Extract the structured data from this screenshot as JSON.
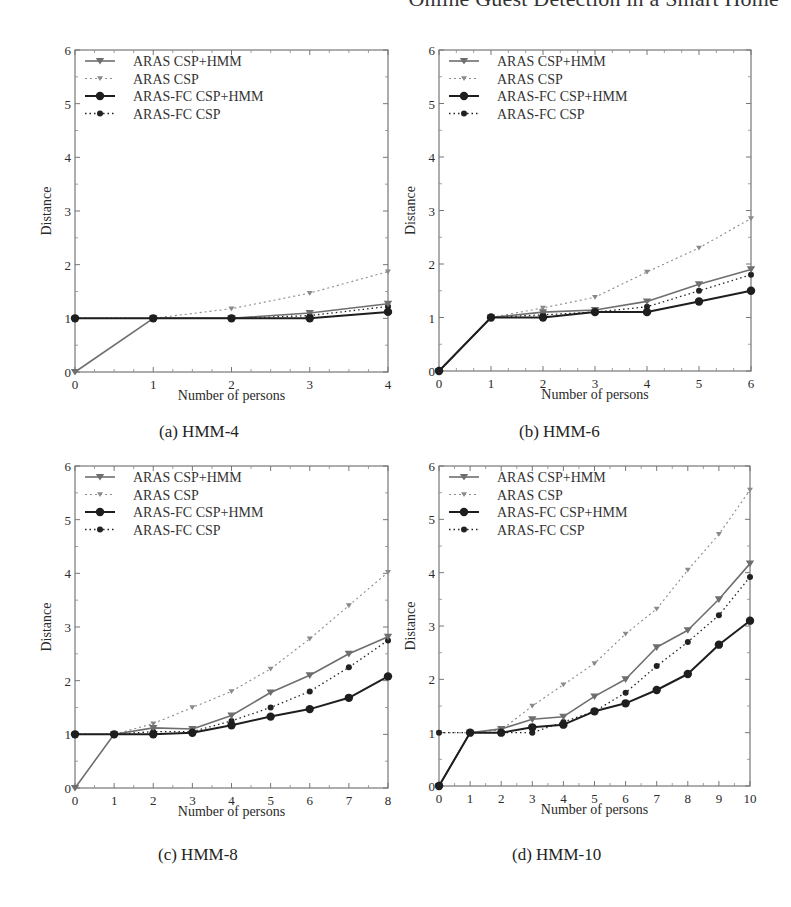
{
  "header": {
    "title": "Online Guest Detection in a Smart Home"
  },
  "legend": [
    {
      "label": "ARAS CSP+HMM",
      "color": "#6e6e6e",
      "dash": "",
      "marker": "triangle",
      "width": 1.6
    },
    {
      "label": "ARAS CSP",
      "color": "#8a8a8a",
      "dash": "2,3",
      "marker": "triangle-small",
      "width": 1.1
    },
    {
      "label": "ARAS-FC CSP+HMM",
      "color": "#1e1e1e",
      "dash": "",
      "marker": "circle",
      "width": 2.0
    },
    {
      "label": "ARAS-FC CSP",
      "color": "#222222",
      "dash": "1.5,3",
      "marker": "circle-small",
      "width": 1.3
    }
  ],
  "panels": [
    {
      "caption": "(a) HMM-4"
    },
    {
      "caption": "(b) HMM-6"
    },
    {
      "caption": "(c) HMM-8"
    },
    {
      "caption": "(d) HMM-10"
    }
  ],
  "chart_data": [
    {
      "type": "line",
      "title": "(a) HMM-4",
      "xlabel": "Number of persons",
      "ylabel": "Distance",
      "xlim": [
        0,
        4
      ],
      "ylim": [
        0,
        6
      ],
      "xticks": [
        0,
        1,
        2,
        3,
        4
      ],
      "yticks": [
        0,
        1,
        2,
        3,
        4,
        5,
        6
      ],
      "grid": false,
      "legend_position": "upper left",
      "x": [
        0,
        1,
        2,
        3,
        4
      ],
      "series": [
        {
          "name": "ARAS CSP+HMM",
          "values": [
            0,
            1,
            1,
            1.1,
            1.27
          ]
        },
        {
          "name": "ARAS CSP",
          "values": [
            1,
            1,
            1.18,
            1.47,
            1.87
          ]
        },
        {
          "name": "ARAS-FC CSP+HMM",
          "values": [
            1,
            1,
            1,
            1,
            1.12
          ]
        },
        {
          "name": "ARAS-FC CSP",
          "values": [
            1,
            1,
            1,
            1.05,
            1.22
          ]
        }
      ]
    },
    {
      "type": "line",
      "title": "(b) HMM-6",
      "xlabel": "Number of persons",
      "ylabel": "Distance",
      "xlim": [
        0,
        6
      ],
      "ylim": [
        0,
        6
      ],
      "xticks": [
        0,
        1,
        2,
        3,
        4,
        5,
        6
      ],
      "yticks": [
        0,
        1,
        2,
        3,
        4,
        5,
        6
      ],
      "grid": false,
      "legend_position": "upper left",
      "x": [
        0,
        1,
        2,
        3,
        4,
        5,
        6
      ],
      "series": [
        {
          "name": "ARAS CSP+HMM",
          "values": [
            0,
            1,
            1.1,
            1.14,
            1.3,
            1.62,
            1.9
          ]
        },
        {
          "name": "ARAS CSP",
          "values": [
            0,
            1,
            1.18,
            1.38,
            1.85,
            2.3,
            2.85
          ]
        },
        {
          "name": "ARAS-FC CSP+HMM",
          "values": [
            0,
            1,
            1,
            1.1,
            1.1,
            1.3,
            1.5
          ]
        },
        {
          "name": "ARAS-FC CSP",
          "values": [
            0,
            1,
            1.05,
            1.1,
            1.2,
            1.5,
            1.8
          ]
        }
      ]
    },
    {
      "type": "line",
      "title": "(c) HMM-8",
      "xlabel": "Number of persons",
      "ylabel": "Distance",
      "xlim": [
        0,
        8
      ],
      "ylim": [
        0,
        6
      ],
      "xticks": [
        0,
        1,
        2,
        3,
        4,
        5,
        6,
        7,
        8
      ],
      "yticks": [
        0,
        1,
        2,
        3,
        4,
        5,
        6
      ],
      "grid": false,
      "legend_position": "upper left",
      "x": [
        0,
        1,
        2,
        3,
        4,
        5,
        6,
        7,
        8
      ],
      "series": [
        {
          "name": "ARAS CSP+HMM",
          "values": [
            0,
            1,
            1.12,
            1.1,
            1.35,
            1.78,
            2.1,
            2.5,
            2.82
          ]
        },
        {
          "name": "ARAS CSP",
          "values": [
            1,
            1,
            1.2,
            1.5,
            1.8,
            2.22,
            2.78,
            3.4,
            4.02
          ]
        },
        {
          "name": "ARAS-FC CSP+HMM",
          "values": [
            1,
            1,
            1,
            1.03,
            1.17,
            1.33,
            1.47,
            1.68,
            2.08
          ]
        },
        {
          "name": "ARAS-FC CSP",
          "values": [
            1,
            1,
            1.05,
            1.05,
            1.25,
            1.5,
            1.8,
            2.25,
            2.75
          ]
        }
      ]
    },
    {
      "type": "line",
      "title": "(d) HMM-10",
      "xlabel": "Number of persons",
      "ylabel": "Distance",
      "xlim": [
        0,
        10
      ],
      "ylim": [
        0,
        6
      ],
      "xticks": [
        0,
        1,
        2,
        3,
        4,
        5,
        6,
        7,
        8,
        9,
        10
      ],
      "yticks": [
        0,
        1,
        2,
        3,
        4,
        5,
        6
      ],
      "grid": false,
      "legend_position": "upper left",
      "x": [
        0,
        1,
        2,
        3,
        4,
        5,
        6,
        7,
        8,
        9,
        10
      ],
      "series": [
        {
          "name": "ARAS CSP+HMM",
          "values": [
            0,
            1,
            1.07,
            1.25,
            1.3,
            1.68,
            2.0,
            2.6,
            2.92,
            3.5,
            4.17
          ]
        },
        {
          "name": "ARAS CSP",
          "values": [
            1,
            1,
            1.05,
            1.5,
            1.9,
            2.3,
            2.85,
            3.32,
            4.05,
            4.72,
            5.55
          ]
        },
        {
          "name": "ARAS-FC CSP+HMM",
          "values": [
            0,
            1,
            1,
            1.1,
            1.15,
            1.4,
            1.55,
            1.8,
            2.1,
            2.65,
            3.1
          ]
        },
        {
          "name": "ARAS-FC CSP",
          "values": [
            1,
            1,
            1,
            1,
            1.2,
            1.4,
            1.75,
            2.25,
            2.7,
            3.2,
            3.92
          ]
        }
      ]
    }
  ]
}
